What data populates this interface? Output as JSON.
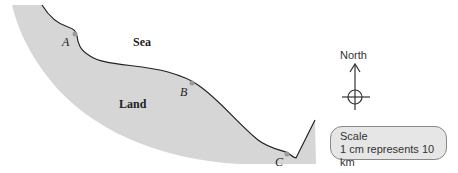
{
  "map": {
    "regions": {
      "sea": "Sea",
      "land": "Land"
    },
    "points": [
      {
        "id": "A",
        "label": "A"
      },
      {
        "id": "B",
        "label": "B"
      },
      {
        "id": "C",
        "label": "C"
      }
    ],
    "compass": {
      "label": "North"
    },
    "scale": {
      "title": "Scale",
      "text": "1 cm represents 10 km"
    },
    "colors": {
      "land": "#d6d6d6",
      "coast": "#222222",
      "point": "#999999"
    }
  }
}
